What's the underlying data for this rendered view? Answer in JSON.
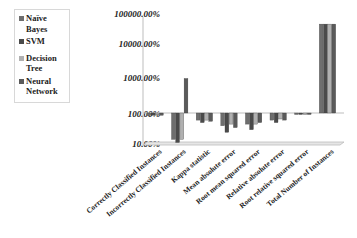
{
  "chart_data": {
    "type": "bar",
    "title": "",
    "xlabel": "",
    "ylabel": "",
    "yscale": "log",
    "ylim": [
      10,
      100000
    ],
    "ytick_labels": [
      "100000.00%",
      "10000.00%",
      "1000.00%",
      "100.00%",
      "10.00%"
    ],
    "categories": [
      "Correctly Classified Instances",
      "Incorrectly Classified Instances",
      "Kappa statistic",
      "Mean absolute error",
      "Root mean squared error",
      "Relative absolute error",
      "Root relative squared error",
      "Total Number of Instances"
    ],
    "series": [
      {
        "name": "Naïve Bayes",
        "color": "#6e6e6e",
        "values": [
          85,
          15,
          60,
          40,
          45,
          60,
          90,
          60000
        ]
      },
      {
        "name": "SVM",
        "color": "#4a4a4a",
        "values": [
          85,
          12,
          50,
          25,
          30,
          50,
          92,
          60000
        ]
      },
      {
        "name": "Decision Tree",
        "color": "#b0b0b0",
        "values": [
          88,
          15,
          60,
          45,
          45,
          65,
          95,
          60000
        ]
      },
      {
        "name": "Neural Network",
        "color": "#5a5a5a",
        "values": [
          85,
          1200,
          55,
          35,
          50,
          60,
          90,
          60000
        ]
      }
    ],
    "legend_position": "left",
    "grid": false
  },
  "legend": {
    "items": [
      {
        "label": "Naïve Bayes",
        "color": "#6e6e6e"
      },
      {
        "label": "SVM",
        "color": "#4a4a4a"
      },
      {
        "label": "Decision Tree",
        "color": "#b0b0b0"
      },
      {
        "label": "Neural Network",
        "color": "#5a5a5a"
      }
    ]
  },
  "axis": {
    "y_ticks": [
      "100000.00%",
      "10000.00%",
      "1000.00%",
      "100.00%",
      "10.00%"
    ],
    "x_labels": [
      "Correctly Classified Instances",
      "Incorrectly Classified Instances",
      "Kappa statistic",
      "Mean absolute error",
      "Root mean squared error",
      "Relative absolute error",
      "Root relative squared error",
      "Total Number of Instances"
    ]
  }
}
